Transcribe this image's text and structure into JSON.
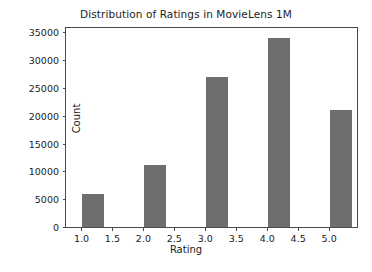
{
  "chart_data": {
    "type": "bar",
    "title": "Distribution of Ratings in MovieLens 1M",
    "xlabel": "Rating",
    "ylabel": "Count",
    "categories": [
      "1.0",
      "2.0",
      "3.0",
      "4.0",
      "5.0"
    ],
    "x": [
      1,
      2,
      3,
      4,
      5
    ],
    "values": [
      6100,
      11400,
      27100,
      34200,
      21200
    ],
    "bar_width": 0.38,
    "bar_align": "bin-right",
    "xlim": [
      0.75,
      5.45
    ],
    "ylim": [
      0,
      35800
    ],
    "xticks": [
      "1.0",
      "1.5",
      "2.0",
      "2.5",
      "3.0",
      "3.5",
      "4.0",
      "4.5",
      "5.0"
    ],
    "xtick_values": [
      1.0,
      1.5,
      2.0,
      2.5,
      3.0,
      3.5,
      4.0,
      4.5,
      5.0
    ],
    "yticks": [
      "0",
      "5000",
      "10000",
      "15000",
      "20000",
      "25000",
      "30000",
      "35000"
    ],
    "ytick_values": [
      0,
      5000,
      10000,
      15000,
      20000,
      25000,
      30000,
      35000
    ],
    "grid": false,
    "legend": null,
    "bar_color": "#6e6e6e",
    "bar_edge_color": "#ffffff",
    "axis_color": "#4a4a4a",
    "background_color": "#ffffff"
  }
}
